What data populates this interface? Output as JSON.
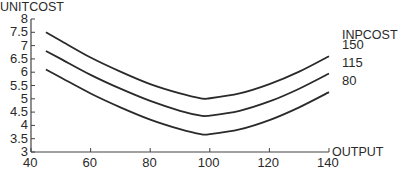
{
  "chart_data": {
    "type": "line",
    "title": "",
    "xlabel": "OUTPUT",
    "ylabel": "UNITCOST",
    "legend_title": "INPCOST",
    "xlim": [
      40,
      140
    ],
    "ylim": [
      3,
      8
    ],
    "x_ticks": [
      40,
      60,
      80,
      100,
      120,
      140
    ],
    "y_ticks": [
      3,
      3.5,
      4,
      4.5,
      5,
      5.5,
      6,
      6.5,
      7,
      7.5,
      8
    ],
    "y_tick_labels": [
      "3",
      "3.5",
      "4",
      "4.5",
      "5",
      "5.5",
      "6",
      "6.5",
      "7",
      "7.5",
      "8"
    ],
    "grid": false,
    "x": [
      45,
      50,
      60,
      70,
      80,
      90,
      97,
      100,
      110,
      120,
      130,
      140
    ],
    "series": [
      {
        "name": "150",
        "values": [
          7.5,
          7.18,
          6.55,
          6.02,
          5.55,
          5.2,
          5.02,
          5.02,
          5.2,
          5.55,
          6.02,
          6.6
        ]
      },
      {
        "name": "115",
        "values": [
          6.8,
          6.5,
          5.9,
          5.38,
          4.92,
          4.55,
          4.37,
          4.37,
          4.55,
          4.9,
          5.38,
          5.95
        ]
      },
      {
        "name": "80",
        "values": [
          6.1,
          5.8,
          5.2,
          4.68,
          4.22,
          3.86,
          3.67,
          3.67,
          3.85,
          4.2,
          4.68,
          5.25
        ]
      }
    ],
    "legend_position": "right, labels at curve ends"
  },
  "labels": {
    "y_axis": "UNITCOST",
    "x_axis": "OUTPUT",
    "legend_title": "INPCOST"
  }
}
